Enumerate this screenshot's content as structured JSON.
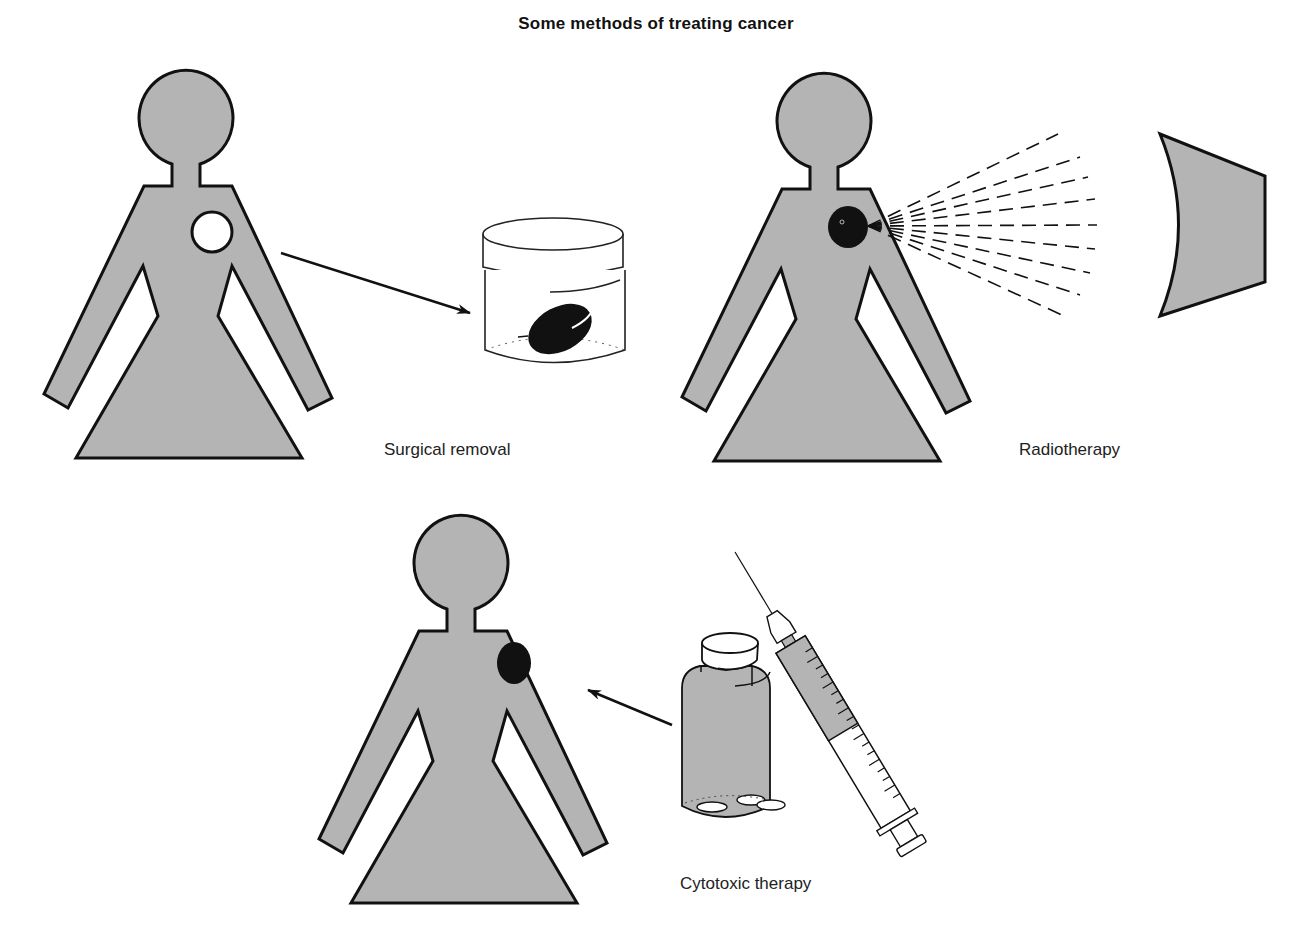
{
  "title": "Some methods of treating cancer",
  "colors": {
    "figure_fill": "#b4b4b4",
    "outline": "#111111",
    "tumor": "#111111",
    "removed_site": "#ffffff",
    "background": "#ffffff"
  },
  "panels": [
    {
      "id": "surgical-removal",
      "caption": "Surgical removal",
      "elements": [
        "human-figure",
        "white-circle-removed-site",
        "arrow-to-jar",
        "specimen-jar-with-tumor"
      ]
    },
    {
      "id": "radiotherapy",
      "caption": "Radiotherapy",
      "elements": [
        "human-figure",
        "black-tumor",
        "radiation-source",
        "dashed-radiation-beams"
      ]
    },
    {
      "id": "cytotoxic-therapy",
      "caption": "Cytotoxic therapy",
      "elements": [
        "human-figure",
        "black-tumor",
        "arrow-to-figure",
        "pill-bottle-with-tablets",
        "syringe"
      ]
    }
  ]
}
